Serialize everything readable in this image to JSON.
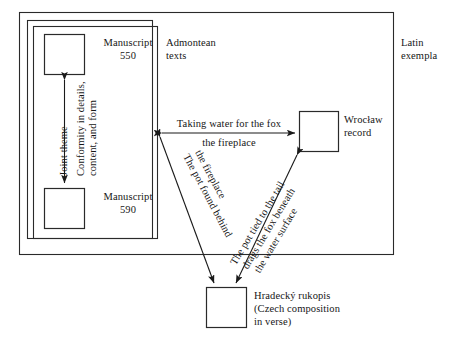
{
  "diagram": {
    "type": "relationship-diagram",
    "frames": [
      {
        "name": "latin-exempla-frame",
        "label": "Latin\nexempla",
        "label_line1": "Latin",
        "label_line2": "exempla"
      },
      {
        "name": "admontean-texts-frame",
        "label_line1": "Admontean",
        "label_line2": "texts"
      }
    ],
    "nodes": [
      {
        "id": "ms550",
        "label_line1": "Manuscript",
        "label_line2": "550"
      },
      {
        "id": "ms590",
        "label_line1": "Manuscript",
        "label_line2": "590"
      },
      {
        "id": "wroclaw",
        "label_line1": "Wrocław",
        "label_line2": "record"
      },
      {
        "id": "hradecky",
        "title": "Hradecký rukopis",
        "subtitle_line1": "(Czech composition",
        "subtitle_line2": "in verse)"
      }
    ],
    "edges": [
      {
        "id": "ms550-ms590",
        "from": "ms550",
        "to": "ms590",
        "arrow": "double",
        "label_a": "Joint theme",
        "label_b_line1": "Conformity in details,",
        "label_b_line2": "content, and form"
      },
      {
        "id": "admontean-wroclaw",
        "from": "admontean-texts-frame",
        "to": "wroclaw",
        "arrow": "double",
        "label_line1": "Taking water for the fox",
        "label_line2": "The pot speaks"
      },
      {
        "id": "admontean-hradecky",
        "from": "admontean-texts-frame",
        "to": "hradecky",
        "arrow": "double",
        "label_line1": "The pot found behind",
        "label_line2": "the fireplace"
      },
      {
        "id": "wroclaw-hradecky",
        "from": "wroclaw",
        "to": "hradecky",
        "arrow": "double",
        "label_line1": "The pot tied to the tail",
        "label_line2": "drags the fox beneath",
        "label_line3": "the water surface"
      }
    ],
    "colors": {
      "line": "#1a1a1a",
      "text": "#161616",
      "background": "#ffffff"
    }
  }
}
